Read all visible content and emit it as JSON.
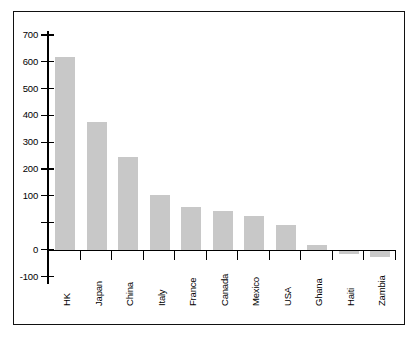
{
  "chart_data": {
    "type": "bar",
    "title": "",
    "subtitle": "",
    "xlabel": "",
    "ylabel": "",
    "categories": [
      "HK",
      "Japan",
      "China",
      "Italy",
      "France",
      "Canada",
      "Mexico",
      "USA",
      "Ghana",
      "Haiti",
      "Zambia"
    ],
    "values": [
      630,
      418,
      302,
      180,
      140,
      127,
      110,
      80,
      15,
      -8,
      -18
    ],
    "series": [
      {
        "name": "",
        "values": [
          630,
          418,
          302,
          180,
          140,
          127,
          110,
          80,
          15,
          -8,
          -18
        ]
      }
    ],
    "ylim": [
      -100,
      700
    ],
    "ytick_labels": [
      "700",
      "600",
      "500",
      "400",
      "300",
      "200",
      "100",
      "0",
      "-100"
    ],
    "ytick_values": [
      700,
      600,
      500,
      400,
      300,
      200,
      100,
      0,
      -100
    ],
    "grid": false,
    "legend": false,
    "legend_position": "none",
    "bar_color": "#c8c8c8",
    "axis_color": "#000000",
    "background_color": "#ffffff",
    "xtick_label_rotation": 90
  }
}
